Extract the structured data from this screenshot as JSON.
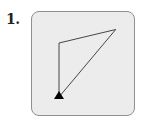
{
  "problem": {
    "number_label": "1."
  },
  "diagram": {
    "vertices": [
      {
        "name": "start",
        "x": 0,
        "y": 0
      },
      {
        "name": "top-left",
        "x": 0,
        "y": 1
      },
      {
        "name": "top-right",
        "x": 1.05,
        "y": 1.25
      }
    ],
    "path_order": [
      "start",
      "top-left",
      "top-right",
      "start"
    ],
    "start_marker": "triangle-icon",
    "colors": {
      "panel_fill": "#ececec",
      "panel_border": "#8f8f8f",
      "line": "#333333",
      "marker": "#000000"
    }
  }
}
